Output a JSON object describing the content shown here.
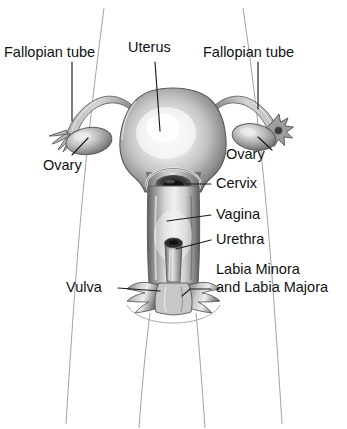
{
  "figure": {
    "type": "anatomical-diagram",
    "background_color": "#ffffff",
    "ink_color": "#111111",
    "outline_color": "#9a9a9a",
    "organ_shades": {
      "highlight": "#f4f4f4",
      "midtone": "#b8b8b8",
      "shadow": "#6e6e6e",
      "deep_shadow": "#3a3a3a"
    }
  },
  "labels": {
    "fallopian_tube_left": "Fallopian tube",
    "uterus": "Uterus",
    "fallopian_tube_right": "Fallopian tube",
    "ovary_left": "Ovary",
    "ovary_right": "Ovary",
    "cervix": "Cervix",
    "vagina": "Vagina",
    "urethra": "Urethra",
    "vulva": "Vulva",
    "labia_line1": "Labia Minora",
    "labia_line2": "and Labia Majora"
  },
  "structures": [
    "uterus",
    "fallopian-tube-left",
    "fallopian-tube-right",
    "fimbriae-left",
    "fimbriae-right",
    "ovary-left",
    "ovary-right",
    "cervix",
    "vagina",
    "urethra",
    "vulva",
    "labia-minora",
    "labia-majora",
    "body-outline"
  ]
}
